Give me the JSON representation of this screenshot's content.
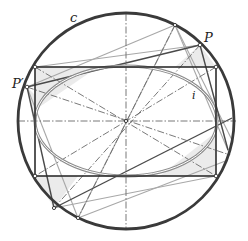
{
  "figure": {
    "labels": {
      "circle": "c",
      "ellipse": "i",
      "point_p": "P",
      "point_p_prime": "P′"
    },
    "colors": {
      "circle": "#3a3a3a",
      "rectangle": "#2e2e2e",
      "ellipse": "#8c8c8c",
      "light_lines": "#a8a8a8",
      "dash_lines": "#6a6a6a",
      "fill": "#e9e9e9"
    },
    "geometry": {
      "center": [
        126,
        121
      ],
      "circle_radius": 108,
      "rectangle": {
        "x1": 35,
        "y1": 67,
        "x2": 216,
        "y2": 176
      },
      "ellipse": {
        "rx": 91,
        "ry": 55
      },
      "P": [
        200,
        45
      ],
      "P_prime": [
        27,
        87
      ]
    }
  }
}
